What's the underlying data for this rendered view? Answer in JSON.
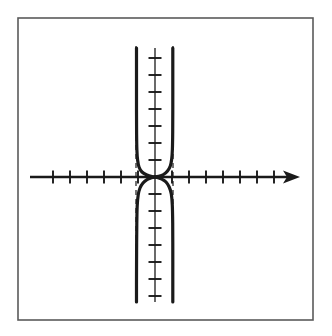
{
  "figure": {
    "kind": "math-graph",
    "background_color": "#ffffff",
    "ink_color": "#1a1a1a",
    "frame_color": "#5a5a5a"
  },
  "frame": {
    "x": 18,
    "y": 18,
    "width": 295,
    "height": 302,
    "stroke_width": 1.6
  },
  "chart_data": {
    "type": "line",
    "title": "",
    "subtitle": "",
    "xlabel": "",
    "ylabel": "",
    "grid": false,
    "legend": null,
    "annotations": [],
    "axes": {
      "x_axis": {
        "pixel_y": 177,
        "pixel_x_start": 30,
        "pixel_x_end": 300,
        "has_arrow_right": true,
        "has_arrow_left": false,
        "stroke_width": 2.6,
        "tick_length": 13,
        "tick_spacing_px": 17,
        "ticks_left_of_origin": 6,
        "ticks_right_of_origin": 7,
        "tick_values_left": [
          -6,
          -5,
          -4,
          -3,
          -2,
          -1
        ],
        "tick_values_right": [
          1,
          2,
          3,
          4,
          5,
          6,
          7
        ]
      },
      "y_axis": {
        "pixel_x": 155,
        "pixel_y_top": 48,
        "pixel_y_bottom": 302,
        "has_arrow_top": false,
        "has_arrow_bottom": false,
        "stroke_width": 1.3,
        "tick_length": 13,
        "tick_spacing_px": 17,
        "ticks_above_origin": 7,
        "ticks_below_origin": 7,
        "tick_values_above": [
          1,
          2,
          3,
          4,
          5,
          6,
          7
        ],
        "tick_values_below": [
          -1,
          -2,
          -3,
          -4,
          -5,
          -6,
          -7
        ]
      },
      "origin": {
        "pixel_x": 155,
        "pixel_y": 177
      },
      "xlim": [
        -7.4,
        8.6
      ],
      "ylim": [
        -7.6,
        7.6
      ]
    },
    "asymptotes": [
      {
        "name": "left-vertical-asymptote",
        "type": "vertical",
        "x_value": -1.1,
        "pixel_x": 136,
        "style": "dashed",
        "stroke_width": 1.2
      },
      {
        "name": "right-vertical-asymptote",
        "type": "vertical",
        "x_value": 1.05,
        "pixel_x": 173,
        "style": "dashed",
        "stroke_width": 1.2
      }
    ],
    "series": [
      {
        "name": "left-branch",
        "style": "solid",
        "stroke_width": 3.2,
        "points_px": [
          [
            136.5,
            48
          ],
          [
            136.5,
            80
          ],
          [
            136.5,
            110
          ],
          [
            136.6,
            134
          ],
          [
            136.9,
            150
          ],
          [
            137.6,
            160
          ],
          [
            139.0,
            167
          ],
          [
            142.0,
            172
          ],
          [
            147.0,
            175
          ],
          [
            152.0,
            176.6
          ],
          [
            155.0,
            177
          ]
        ]
      },
      {
        "name": "right-branch-upper",
        "style": "solid",
        "stroke_width": 3.2,
        "points_px": [
          [
            155.0,
            177
          ],
          [
            158.5,
            176.4
          ],
          [
            163.5,
            174.5
          ],
          [
            167.5,
            171.0
          ],
          [
            170.3,
            166.0
          ],
          [
            171.7,
            159.0
          ],
          [
            172.4,
            149.0
          ],
          [
            172.7,
            132.0
          ],
          [
            172.8,
            105.0
          ],
          [
            172.8,
            75.0
          ],
          [
            172.8,
            48.0
          ]
        ]
      },
      {
        "name": "left-branch-lower",
        "style": "solid",
        "stroke_width": 3.2,
        "points_px": [
          [
            155.0,
            177
          ],
          [
            151.5,
            177.8
          ],
          [
            147.0,
            179.6
          ],
          [
            143.0,
            183.0
          ],
          [
            140.0,
            188.0
          ],
          [
            138.2,
            195.0
          ],
          [
            137.2,
            206.0
          ],
          [
            136.8,
            224.0
          ],
          [
            136.6,
            252.0
          ],
          [
            136.5,
            280.0
          ],
          [
            136.5,
            302.0
          ]
        ]
      },
      {
        "name": "right-branch-lower",
        "style": "solid",
        "stroke_width": 3.2,
        "points_px": [
          [
            155.0,
            177
          ],
          [
            158.0,
            177.6
          ],
          [
            162.0,
            179.2
          ],
          [
            166.0,
            182.0
          ],
          [
            169.2,
            187.0
          ],
          [
            171.3,
            194.0
          ],
          [
            172.3,
            205.0
          ],
          [
            172.7,
            223.0
          ],
          [
            172.8,
            251.0
          ],
          [
            172.8,
            280.0
          ],
          [
            172.8,
            302.0
          ]
        ]
      }
    ]
  }
}
